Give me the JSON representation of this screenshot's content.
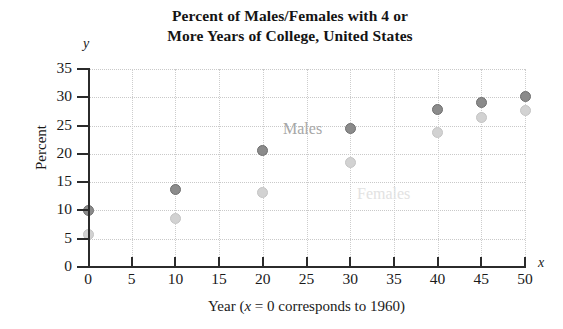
{
  "chart_data": {
    "type": "scatter",
    "title": "Percent of Males/Females with 4 or More Years of College, United States",
    "title_line1": "Percent of Males/Females with 4 or",
    "title_line2": "More Years of College, United States",
    "xlabel": "Year (x = 0 corresponds to 1960)",
    "xlabel_prefix": "Year (",
    "xlabel_var": "x",
    "xlabel_suffix": " = 0 corresponds to 1960)",
    "ylabel": "Percent",
    "x_axis_letter": "x",
    "y_axis_letter": "y",
    "xlim": [
      0,
      50
    ],
    "ylim": [
      0,
      35
    ],
    "xticks": [
      0,
      5,
      10,
      15,
      20,
      25,
      30,
      35,
      40,
      45,
      50
    ],
    "yticks": [
      0,
      5,
      10,
      15,
      20,
      25,
      30,
      35
    ],
    "grid": true,
    "legend_position": "inline-annotations",
    "x": [
      0,
      10,
      20,
      30,
      40,
      45,
      50
    ],
    "series": [
      {
        "name": "Males",
        "color": "#8b8b8b",
        "values": [
          10.0,
          13.7,
          20.6,
          24.4,
          27.8,
          29.0,
          30.1
        ]
      },
      {
        "name": "Females",
        "color": "#d2d2d2",
        "values": [
          5.8,
          8.6,
          13.1,
          18.4,
          23.7,
          26.5,
          27.6
        ]
      }
    ],
    "annotations": [
      {
        "text": "Males",
        "x": 28,
        "y": 25.2
      },
      {
        "text": "Females",
        "x": 36,
        "y": 13.5
      }
    ]
  }
}
